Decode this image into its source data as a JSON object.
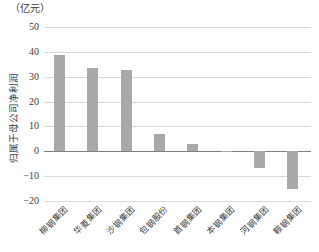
{
  "chart_data": {
    "type": "bar",
    "title": "",
    "unit_label": "（亿元）",
    "ylabel": "归属于母公司净利润",
    "xlabel": "",
    "categories": [
      "柳钢集团",
      "华菱集团",
      "沙钢集团",
      "包钢股份",
      "首钢集团",
      "本钢集团",
      "河钢集团",
      "鞍钢集团"
    ],
    "values": [
      38.7,
      33.5,
      32.8,
      6.9,
      2.8,
      -0.3,
      -6.8,
      -15.2
    ],
    "ylim": [
      -20,
      50
    ],
    "yticks": [
      50,
      40,
      30,
      20,
      10,
      0,
      -10,
      -20
    ],
    "ytick_labels": [
      "50",
      "40",
      "30",
      "20",
      "10",
      "0",
      "−10",
      "−20"
    ],
    "grid": true,
    "legend": "none",
    "bar_color": "#a9a9a9",
    "gridline_color": "#d9d9d9",
    "zero_line_color": "#7f7f7f",
    "text_color": "#3c3c3c",
    "background": "#ffffff"
  }
}
